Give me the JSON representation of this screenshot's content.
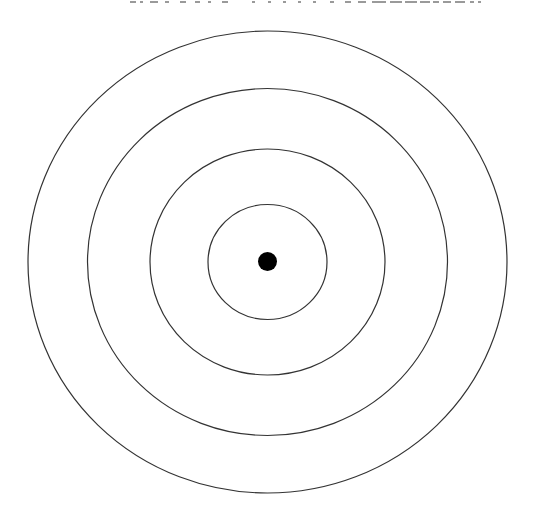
{
  "caption": {
    "text": "",
    "note_visible": "bottom edge of a clipped text line at top of image; glyphs are cut off and unreadable",
    "ends_with": "。"
  },
  "diagram": {
    "type": "concentric-circles",
    "center": {
      "x": 267.5,
      "y": 262
    },
    "stroke_color": "#333333",
    "fill_color": "#ffffff",
    "background": "#ffffff",
    "rings": [
      {
        "name": "ring-1-inner",
        "rx": 59.5,
        "ry": 57.5
      },
      {
        "name": "ring-2",
        "rx": 117.5,
        "ry": 113
      },
      {
        "name": "ring-3",
        "rx": 180,
        "ry": 173.5
      },
      {
        "name": "ring-4-outer",
        "rx": 239.5,
        "ry": 231
      }
    ],
    "center_dot": {
      "r": 9.5,
      "color": "#000000"
    }
  },
  "caption_stroke_segments": [
    {
      "x": 130,
      "w": 6
    },
    {
      "x": 140,
      "w": 3
    },
    {
      "x": 150,
      "w": 8
    },
    {
      "x": 165,
      "w": 4
    },
    {
      "x": 180,
      "w": 6
    },
    {
      "x": 195,
      "w": 5
    },
    {
      "x": 208,
      "w": 3
    },
    {
      "x": 222,
      "w": 6
    },
    {
      "x": 252,
      "w": 3
    },
    {
      "x": 268,
      "w": 3
    },
    {
      "x": 283,
      "w": 3
    },
    {
      "x": 298,
      "w": 3
    },
    {
      "x": 313,
      "w": 3
    },
    {
      "x": 330,
      "w": 4
    },
    {
      "x": 345,
      "w": 6
    },
    {
      "x": 358,
      "w": 8
    },
    {
      "x": 372,
      "w": 14
    },
    {
      "x": 390,
      "w": 12
    },
    {
      "x": 405,
      "w": 12
    },
    {
      "x": 420,
      "w": 10
    },
    {
      "x": 433,
      "w": 6
    },
    {
      "x": 443,
      "w": 8
    },
    {
      "x": 455,
      "w": 10
    },
    {
      "x": 470,
      "w": 4
    },
    {
      "x": 478,
      "w": 3
    }
  ]
}
